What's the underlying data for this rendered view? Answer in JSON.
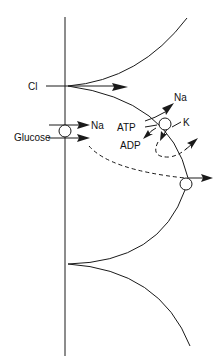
{
  "diagram": {
    "labels": {
      "cl": "Cl",
      "glucose": "Glucose",
      "na_cotransport": "Na",
      "na_pump": "Na",
      "atp": "ATP",
      "adp": "ADP",
      "k": "K"
    },
    "colors": {
      "stroke": "#1a1a1a",
      "background": "#ffffff"
    }
  }
}
